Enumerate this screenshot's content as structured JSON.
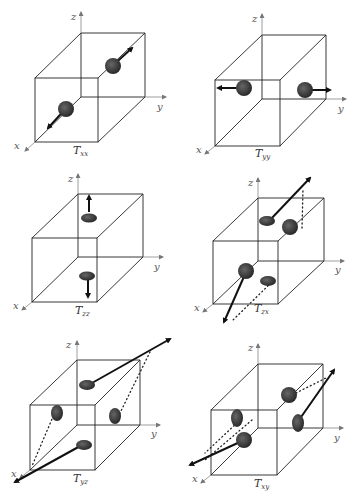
{
  "colors": {
    "edge": "#222222",
    "axis": "#777777",
    "sphere": "#3a3a3a",
    "arrow": "#111111"
  },
  "axes": {
    "x": "x",
    "y": "y",
    "z": "z"
  },
  "panels": [
    {
      "id": "Txx",
      "title_main": "T",
      "title_sub": "xx"
    },
    {
      "id": "Tyy",
      "title_main": "T",
      "title_sub": "yy"
    },
    {
      "id": "Tzz",
      "title_main": "T",
      "title_sub": "zz"
    },
    {
      "id": "Tzx",
      "title_main": "T",
      "title_sub": "zx"
    },
    {
      "id": "Tyz",
      "title_main": "T",
      "title_sub": "yz"
    },
    {
      "id": "Txy",
      "title_main": "T",
      "title_sub": "xy"
    }
  ]
}
